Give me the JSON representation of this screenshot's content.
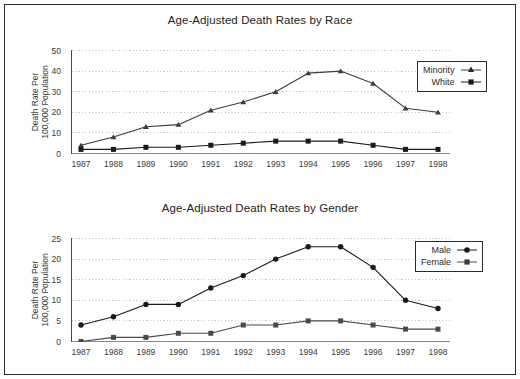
{
  "frame": {
    "border_color": "#2e2e2e",
    "background": "#ffffff"
  },
  "chart_data": [
    {
      "id": "race",
      "type": "line",
      "title": "Age-Adjusted Death Rates by Race",
      "xlabel": "",
      "ylabel": "Death Rate Per\n100,000 Population",
      "ylabel_line1": "Death Rate Per",
      "ylabel_line2": "100,000 Population",
      "categories": [
        "1987",
        "1988",
        "1989",
        "1990",
        "1991",
        "1992",
        "1993",
        "1994",
        "1995",
        "1996",
        "1997",
        "1998"
      ],
      "x": [
        1987,
        1988,
        1989,
        1990,
        1991,
        1992,
        1993,
        1994,
        1995,
        1996,
        1997,
        1998
      ],
      "ylim": [
        0,
        50
      ],
      "yticks": [
        0,
        10,
        20,
        30,
        40,
        50
      ],
      "grid": true,
      "legend_position": "upper right",
      "series": [
        {
          "name": "Minority",
          "marker": "triangle",
          "color": "#3c3c3c",
          "values": [
            4,
            8,
            13,
            14,
            21,
            25,
            30,
            39,
            40,
            34,
            22,
            20
          ]
        },
        {
          "name": "White",
          "marker": "square",
          "color": "#1a1a1a",
          "values": [
            2,
            2,
            3,
            3,
            4,
            5,
            6,
            6,
            6,
            4,
            2,
            2
          ]
        }
      ]
    },
    {
      "id": "gender",
      "type": "line",
      "title": "Age-Adjusted Death Rates by Gender",
      "xlabel": "",
      "ylabel": "Death Rate Per\n100,000 Population",
      "ylabel_line1": "Death Rate Per",
      "ylabel_line2": "100,000 Population",
      "categories": [
        "1987",
        "1988",
        "1989",
        "1990",
        "1991",
        "1992",
        "1993",
        "1994",
        "1995",
        "1996",
        "1997",
        "1998"
      ],
      "x": [
        1987,
        1988,
        1989,
        1990,
        1991,
        1992,
        1993,
        1994,
        1995,
        1996,
        1997,
        1998
      ],
      "ylim": [
        0,
        25
      ],
      "yticks": [
        0,
        5,
        10,
        15,
        20,
        25
      ],
      "grid": true,
      "legend_position": "upper right",
      "series": [
        {
          "name": "Male",
          "marker": "circle",
          "color": "#1a1a1a",
          "values": [
            4,
            6,
            9,
            9,
            13,
            16,
            20,
            23,
            23,
            18,
            10,
            8
          ]
        },
        {
          "name": "Female",
          "marker": "square",
          "color": "#4a4a4a",
          "values": [
            0,
            1,
            1,
            2,
            2,
            4,
            4,
            5,
            5,
            4,
            3,
            3
          ]
        }
      ]
    }
  ]
}
